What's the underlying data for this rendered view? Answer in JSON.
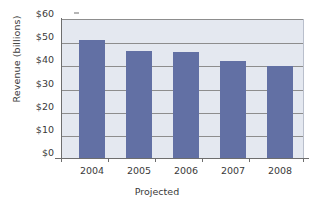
{
  "chart_data": {
    "type": "bar",
    "title": "",
    "subtitle": "",
    "xlabel": "Projected",
    "ylabel": "Revenue (billions)",
    "categories": [
      "2004",
      "2005",
      "2006",
      "2007",
      "2008"
    ],
    "values": [
      51.5,
      46.5,
      46.3,
      42.2,
      40.0
    ],
    "series": [
      {
        "name": "Revenue",
        "values": [
          51.5,
          46.5,
          46.3,
          42.2,
          40.0
        ]
      }
    ],
    "ylim": [
      0,
      60
    ],
    "ytick_values": [
      0,
      10,
      20,
      30,
      40,
      50,
      60
    ],
    "ytick_labels": [
      "$0",
      "$10",
      "$20",
      "$30",
      "$40",
      "$50",
      "$60"
    ],
    "grid": true,
    "grid_axis": "y",
    "legend": false,
    "legend_position": "none",
    "annotations": [],
    "colors": {
      "bar": "#6270a4",
      "plot_background": "#e4e8f0",
      "figure_background": "#ffffff",
      "gridline": "#8d8d8d",
      "axis": "#6e6e6e",
      "text": "#3a3a3a"
    }
  }
}
